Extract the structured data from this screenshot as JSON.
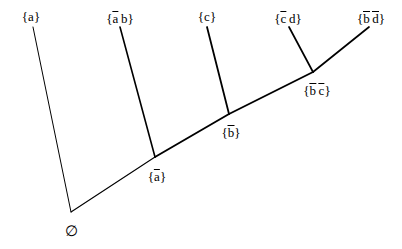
{
  "diagram": {
    "kind": "lattice-tree",
    "background_color": "#ffffff",
    "line_color": "#000000",
    "canvas": {
      "width": 402,
      "height": 249
    },
    "root": {
      "id": "root",
      "label": "∅",
      "label_name": "empty-set",
      "x": 71,
      "y": 224
    },
    "nodes": [
      {
        "id": "n-a-bar",
        "label_text": "{ā}",
        "parts": [
          {
            "t": "{",
            "bar": false
          },
          {
            "t": "a",
            "bar": true
          },
          {
            "t": "}",
            "bar": false
          }
        ],
        "x": 157,
        "y": 168,
        "anchor_x": 155,
        "anchor_y": 157
      },
      {
        "id": "n-b-bar",
        "label_text": "{b̄}",
        "parts": [
          {
            "t": "{",
            "bar": false
          },
          {
            "t": "b",
            "bar": true
          },
          {
            "t": "}",
            "bar": false
          }
        ],
        "x": 231,
        "y": 124,
        "anchor_x": 229,
        "anchor_y": 114
      },
      {
        "id": "n-bc-bar",
        "label_text": "{b̄ c̄}",
        "parts": [
          {
            "t": "{",
            "bar": false
          },
          {
            "t": "b",
            "bar": true
          },
          {
            "t": " ",
            "bar": false
          },
          {
            "t": "c",
            "bar": true
          },
          {
            "t": "}",
            "bar": false
          }
        ],
        "x": 317,
        "y": 82,
        "anchor_x": 313,
        "anchor_y": 72
      }
    ],
    "leaves": [
      {
        "id": "leaf-a",
        "label_text": "{a}",
        "parts": [
          {
            "t": "{",
            "bar": false
          },
          {
            "t": "a",
            "bar": false
          },
          {
            "t": "}",
            "bar": false
          }
        ],
        "x": 31,
        "y": 10,
        "anchor_x": 33,
        "anchor_y": 27
      },
      {
        "id": "leaf-ab",
        "label_text": "{ā b}",
        "parts": [
          {
            "t": "{",
            "bar": false
          },
          {
            "t": "a",
            "bar": true
          },
          {
            "t": " ",
            "bar": false
          },
          {
            "t": "b",
            "bar": false
          },
          {
            "t": "}",
            "bar": false
          }
        ],
        "x": 120,
        "y": 10,
        "anchor_x": 120,
        "anchor_y": 27
      },
      {
        "id": "leaf-c",
        "label_text": "{c}",
        "parts": [
          {
            "t": "{",
            "bar": false
          },
          {
            "t": "c",
            "bar": false
          },
          {
            "t": "}",
            "bar": false
          }
        ],
        "x": 207,
        "y": 10,
        "anchor_x": 207,
        "anchor_y": 27
      },
      {
        "id": "leaf-cd",
        "label_text": "{c̄ d}",
        "parts": [
          {
            "t": "{",
            "bar": false
          },
          {
            "t": "c",
            "bar": true
          },
          {
            "t": " ",
            "bar": false
          },
          {
            "t": "d",
            "bar": false
          },
          {
            "t": "}",
            "bar": false
          }
        ],
        "x": 288,
        "y": 10,
        "anchor_x": 289,
        "anchor_y": 27
      },
      {
        "id": "leaf-bd",
        "label_text": "{b̄ d̄}",
        "parts": [
          {
            "t": "{",
            "bar": false
          },
          {
            "t": "b",
            "bar": true
          },
          {
            "t": " ",
            "bar": false
          },
          {
            "t": "d",
            "bar": true
          },
          {
            "t": "}",
            "bar": false
          }
        ],
        "x": 371,
        "y": 10,
        "anchor_x": 369,
        "anchor_y": 27
      }
    ],
    "edges": [
      {
        "id": "edge-root-a",
        "from": "root",
        "to": "leaf-a",
        "x1": 71,
        "y1": 212,
        "x2": 33,
        "y2": 27,
        "width": 1.0
      },
      {
        "id": "edge-root-abar",
        "from": "root",
        "to": "n-a-bar",
        "x1": 71,
        "y1": 212,
        "x2": 155,
        "y2": 157,
        "width": 1.1
      },
      {
        "id": "edge-abar-ab",
        "from": "n-a-bar",
        "to": "leaf-ab",
        "x1": 155,
        "y1": 157,
        "x2": 120,
        "y2": 27,
        "width": 1.6
      },
      {
        "id": "edge-abar-bbar",
        "from": "n-a-bar",
        "to": "n-b-bar",
        "x1": 155,
        "y1": 157,
        "x2": 229,
        "y2": 114,
        "width": 1.9
      },
      {
        "id": "edge-bbar-c",
        "from": "n-b-bar",
        "to": "leaf-c",
        "x1": 229,
        "y1": 114,
        "x2": 207,
        "y2": 27,
        "width": 1.8
      },
      {
        "id": "edge-bbar-bcbar",
        "from": "n-b-bar",
        "to": "n-bc-bar",
        "x1": 229,
        "y1": 114,
        "x2": 313,
        "y2": 72,
        "width": 1.9
      },
      {
        "id": "edge-bcbar-cd",
        "from": "n-bc-bar",
        "to": "leaf-cd",
        "x1": 313,
        "y1": 72,
        "x2": 289,
        "y2": 27,
        "width": 1.7
      },
      {
        "id": "edge-bcbar-bd",
        "from": "n-bc-bar",
        "to": "leaf-bd",
        "x1": 313,
        "y1": 72,
        "x2": 369,
        "y2": 27,
        "width": 1.7
      }
    ]
  }
}
